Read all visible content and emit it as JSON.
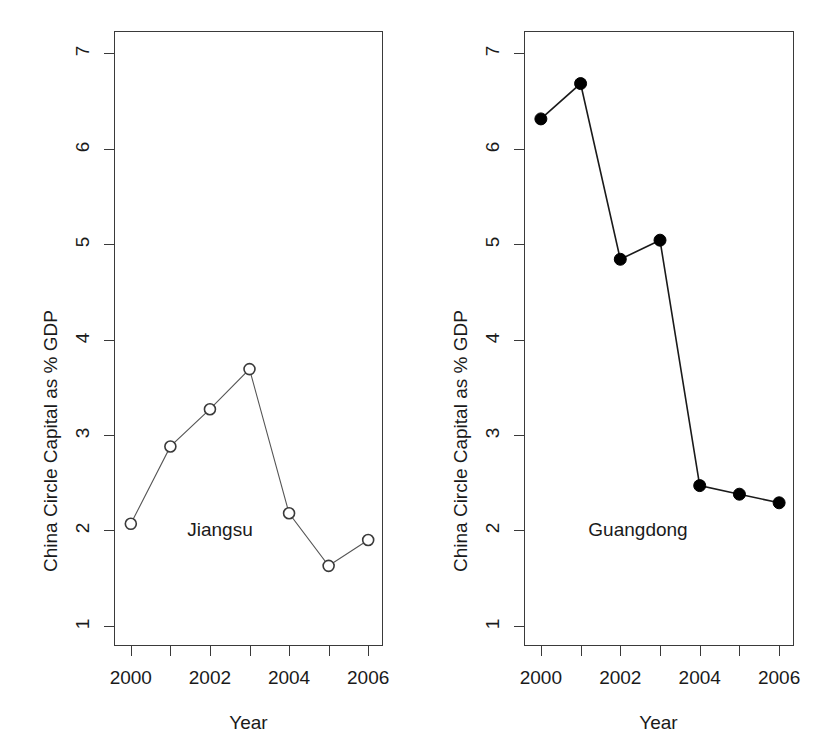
{
  "figure": {
    "background": "#ffffff",
    "axis_color": "#3a3a3a"
  },
  "axes": {
    "xlabel": "Year",
    "ylabel": "China Circle Capital as % GDP",
    "y_ticks": [
      "7",
      "6",
      "5",
      "4",
      "3",
      "2",
      "1"
    ],
    "x_ticks": [
      "2000",
      "",
      "2002",
      "",
      "2004",
      "",
      "2006"
    ],
    "x_tick_years": [
      "2000",
      "2001",
      "2002",
      "2003",
      "2004",
      "2005",
      "2006"
    ]
  },
  "chart_data": [
    {
      "type": "line",
      "title": "Jiangsu",
      "panel": "left",
      "xlabel": "Year",
      "ylabel": "China Circle Capital as % GDP",
      "x": [
        2000,
        2001,
        2002,
        2003,
        2004,
        2005,
        2006
      ],
      "categories": [
        "2000",
        "2001",
        "2002",
        "2003",
        "2004",
        "2005",
        "2006"
      ],
      "values": [
        2.07,
        2.88,
        3.27,
        3.69,
        2.18,
        1.63,
        1.9
      ],
      "xlim": [
        1999.6,
        2006.4
      ],
      "ylim": [
        0.78,
        7.22
      ],
      "grid": false,
      "legend": "none",
      "marker": "open-circle",
      "marker_fill": "#ffffff",
      "line_color": "#555555",
      "point_color": "#3a3a3a"
    },
    {
      "type": "line",
      "title": "Guangdong",
      "panel": "right",
      "xlabel": "Year",
      "ylabel": "China Circle Capital as % GDP",
      "x": [
        2000,
        2001,
        2002,
        2003,
        2004,
        2005,
        2006
      ],
      "categories": [
        "2000",
        "2001",
        "2002",
        "2003",
        "2004",
        "2005",
        "2006"
      ],
      "values": [
        6.31,
        6.68,
        4.84,
        5.04,
        2.47,
        2.38,
        2.29
      ],
      "xlim": [
        1999.6,
        2006.4
      ],
      "ylim": [
        0.78,
        7.22
      ],
      "grid": false,
      "legend": "none",
      "marker": "filled-circle",
      "marker_fill": "#000000",
      "line_color": "#1a1a1a",
      "point_color": "#000000"
    }
  ]
}
